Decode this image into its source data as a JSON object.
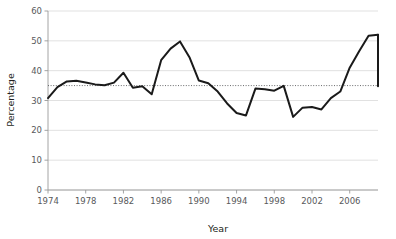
{
  "chart_data": {
    "type": "line",
    "title": "",
    "xlabel": "Year",
    "ylabel": "Percentage",
    "xlim": [
      1974,
      2009
    ],
    "ylim": [
      0,
      60
    ],
    "grid": true,
    "legend": "none",
    "xticks": [
      1974,
      1978,
      1982,
      1986,
      1990,
      1994,
      1998,
      2002,
      2006
    ],
    "xticklabels": [
      "1974",
      "1978",
      "1982",
      "1986",
      "1990",
      "1994",
      "1998",
      "2002",
      "2006"
    ],
    "yticks": [
      0,
      10,
      20,
      30,
      40,
      50,
      60
    ],
    "yticklabels": [
      "0",
      "10",
      "20",
      "30",
      "40",
      "50",
      "60"
    ],
    "x": [
      1974,
      1975,
      1976,
      1977,
      1978,
      1979,
      1980,
      1981,
      1982,
      1983,
      1984,
      1985,
      1986,
      1987,
      1988,
      1989,
      1990,
      1991,
      1992,
      1993,
      1994,
      1995,
      1996,
      1997,
      1998,
      1999,
      2000,
      2001,
      2002,
      2003,
      2004,
      2005,
      2006,
      2007,
      2008,
      2009
    ],
    "values": [
      30.8,
      34.5,
      36.4,
      36.6,
      36.0,
      35.4,
      35.1,
      36.0,
      39.3,
      34.3,
      34.8,
      32.1,
      43.5,
      47.4,
      49.8,
      44.5,
      36.7,
      35.8,
      33.0,
      29.0,
      25.8,
      25.0,
      34.0,
      33.8,
      33.3,
      34.9,
      24.5,
      27.6,
      27.8,
      27.0,
      30.8,
      33.0,
      41.0,
      46.5,
      51.7,
      52.0
    ],
    "values_tail": [
      52.0,
      34.8
    ],
    "annotations": [
      {
        "type": "reference-line",
        "orientation": "horizontal",
        "value": 35.0,
        "style": "dotted",
        "label": ""
      }
    ],
    "series_name": "Percentage",
    "series_color": "#1a1a1a",
    "reference_line_color": "#58595b",
    "gridline_color": "#d9d9d9",
    "axis_color": "#9a9a9a",
    "background_color": "#ffffff"
  }
}
